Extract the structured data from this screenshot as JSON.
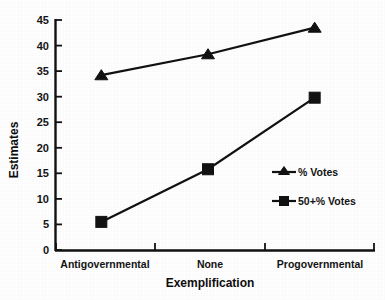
{
  "chart_data": {
    "type": "line",
    "title": "",
    "subtitle": "",
    "xlabel": "Exemplification",
    "ylabel": "Estimates",
    "categories": [
      "Antigovernmental",
      "None",
      "Progovernmental"
    ],
    "series": [
      {
        "name": "% Votes",
        "marker": "triangle",
        "values": [
          34.2,
          38.3,
          43.5
        ]
      },
      {
        "name": "50+% Votes",
        "marker": "square",
        "values": [
          5.5,
          15.8,
          29.8
        ]
      }
    ],
    "ylim": [
      0,
      45
    ],
    "ytick_step": 5,
    "yticks": [
      "0",
      "5",
      "10",
      "15",
      "20",
      "25",
      "30",
      "35",
      "40",
      "45"
    ],
    "xlim_categories": 3,
    "grid": false,
    "legend_position": "lower-right",
    "line_color": "#121212",
    "marker_color": "#121212",
    "background_color": "#ffffff"
  },
  "axes": {
    "y_title": "Estimates",
    "x_title": "Exemplification"
  },
  "legend": {
    "entries": [
      {
        "label": "% Votes",
        "marker": "triangle-up-icon"
      },
      {
        "label": "50+% Votes",
        "marker": "square-icon"
      }
    ]
  },
  "ticks": {
    "y": [
      "45",
      "40",
      "35",
      "30",
      "25",
      "20",
      "15",
      "10",
      "5",
      "0"
    ],
    "x": [
      "Antigovernmental",
      "None",
      "Progovernmental"
    ]
  }
}
